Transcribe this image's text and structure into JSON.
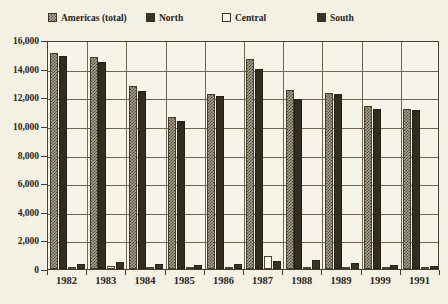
{
  "title_sliver": "",
  "legend": {
    "items": [
      {
        "label": "Americas (total)",
        "swatch": "checkered-swatch-icon",
        "color": "#a9a491"
      },
      {
        "label": "North",
        "swatch": "solid-dark-swatch-icon",
        "color": "#332d20"
      },
      {
        "label": "Central",
        "swatch": "white-swatch-icon",
        "color": "#f6f3e8"
      },
      {
        "label": "South",
        "swatch": "solid-dark-swatch-icon",
        "color": "#3b3426"
      }
    ]
  },
  "chart_data": {
    "type": "bar",
    "title": "",
    "xlabel": "",
    "ylabel": "",
    "ylim": [
      0,
      16000
    ],
    "ytick_step": 2000,
    "ytick_labels": [
      "16,000",
      "14,000",
      "12,000",
      "10,000",
      "8,000",
      "6,000",
      "4,000",
      "2,000",
      "0"
    ],
    "grid": true,
    "legend_position": "top",
    "categories": [
      "1982",
      "1983",
      "1984",
      "1985",
      "1986",
      "1987",
      "1988",
      "1989",
      "1999",
      "1991"
    ],
    "series": [
      {
        "name": "Americas (total)",
        "values": [
          15100,
          14800,
          12800,
          10600,
          12200,
          14700,
          12500,
          12300,
          11400,
          11200
        ]
      },
      {
        "name": "North",
        "values": [
          14900,
          14450,
          12450,
          10350,
          12100,
          14000,
          11900,
          12200,
          11200,
          11100
        ]
      },
      {
        "name": "Central",
        "values": [
          120,
          180,
          130,
          110,
          130,
          900,
          150,
          120,
          90,
          110
        ]
      },
      {
        "name": "South",
        "values": [
          380,
          500,
          380,
          280,
          330,
          540,
          600,
          400,
          300,
          200
        ]
      }
    ]
  }
}
